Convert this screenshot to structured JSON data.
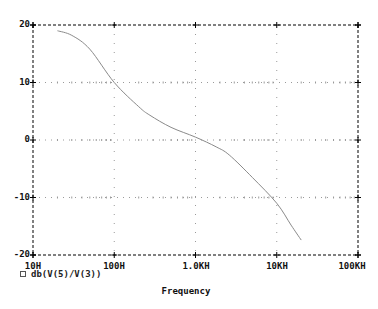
{
  "chart_data": {
    "type": "line",
    "title": "",
    "xlabel": "Frequency",
    "ylabel": "",
    "xscale": "log",
    "xlim": [
      10,
      100000
    ],
    "ylim": [
      -20,
      20
    ],
    "x_ticks": [
      "10H",
      "100H",
      "1.0KH",
      "10KH",
      "100KH"
    ],
    "y_ticks": [
      "20",
      "10",
      "0",
      "-10",
      "-20"
    ],
    "grid": true,
    "legend_position": "bottom-left",
    "series": [
      {
        "name": "db(V(5)/V(3))",
        "x": [
          20,
          30,
          50,
          100,
          200,
          275,
          500,
          1000,
          1800,
          2600,
          5000,
          10000,
          15000,
          20000
        ],
        "y": [
          19.0,
          18.2,
          15.8,
          10.0,
          5.8,
          4.3,
          2.2,
          0.5,
          -1.2,
          -2.6,
          -6.5,
          -11.0,
          -14.8,
          -17.4
        ]
      }
    ]
  },
  "axis": {
    "y_labels": [
      "20",
      "10",
      "0",
      "-10",
      "-20"
    ],
    "x_labels": [
      "10H",
      "100H",
      "1.0KH",
      "10KH",
      "100KH"
    ],
    "x_title": "Frequency"
  },
  "legend": {
    "items": [
      {
        "label": "db(V(5)/V(3))",
        "marker": "square"
      }
    ]
  },
  "colors": {
    "axis": "#000000",
    "grid": "#9a9a9a",
    "trace": "#8a8a8a"
  }
}
